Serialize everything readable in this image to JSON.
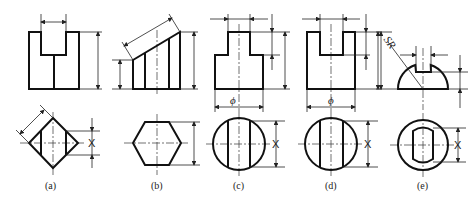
{
  "figure": {
    "panels": [
      {
        "id": "a",
        "label": "(a)",
        "shape": "square prism with slot (front) / diamond with two lines (top)",
        "dim_symbol_top": "X"
      },
      {
        "id": "b",
        "label": "(b)",
        "shape": "hexagonal prism truncated obliquely (front) / hexagon (top)"
      },
      {
        "id": "c",
        "label": "(c)",
        "shape": "stepped cylinder (front) / circle with two chords (top)",
        "diameter_symbol": "ϕ",
        "dim_symbol_top": "X"
      },
      {
        "id": "d",
        "label": "(d)",
        "shape": "cylinder with slot (front) / circle with two chords (top)",
        "diameter_symbol": "ϕ",
        "dim_symbol_top": "X"
      },
      {
        "id": "e",
        "label": "(e)",
        "shape": "hemisphere with slot (front) / circle with slot outline (top)",
        "radius_symbol": "SR",
        "dim_symbol_top": "X"
      }
    ]
  },
  "colors": {
    "stroke": "#111111",
    "background": "#ffffff"
  }
}
